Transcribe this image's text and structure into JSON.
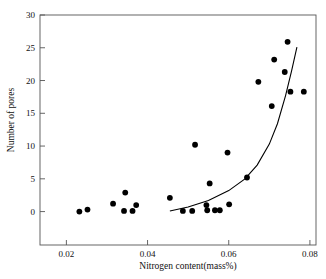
{
  "chart_data": {
    "type": "scatter",
    "title": "",
    "xlabel": "Nitrogen content(mass%)",
    "ylabel": "Number of pores",
    "xlim": [
      0.0135,
      0.0815
    ],
    "ylim": [
      -5.1,
      30
    ],
    "xticks": [
      0.02,
      0.04,
      0.06,
      0.08
    ],
    "xtick_labels": [
      "0.02",
      "0.04",
      "0.06",
      "0.08"
    ],
    "yticks": [
      0,
      5,
      10,
      15,
      20,
      25,
      30
    ],
    "ytick_labels": [
      "0",
      "5",
      "10",
      "15",
      "20",
      "25",
      "30"
    ],
    "grid": false,
    "legend": null,
    "marker_color": "#000000",
    "line_color": "#000000",
    "frame_color": "#555555",
    "points": [
      {
        "x": 0.0232,
        "y": 0.0
      },
      {
        "x": 0.0252,
        "y": 0.3
      },
      {
        "x": 0.0315,
        "y": 1.2
      },
      {
        "x": 0.0345,
        "y": 2.9
      },
      {
        "x": 0.0342,
        "y": 0.1
      },
      {
        "x": 0.0363,
        "y": 0.1
      },
      {
        "x": 0.0372,
        "y": 1.0
      },
      {
        "x": 0.0455,
        "y": 2.1
      },
      {
        "x": 0.0487,
        "y": 0.1
      },
      {
        "x": 0.051,
        "y": 0.1
      },
      {
        "x": 0.0517,
        "y": 10.2
      },
      {
        "x": 0.0545,
        "y": 1.0
      },
      {
        "x": 0.0547,
        "y": 0.2
      },
      {
        "x": 0.0553,
        "y": 4.3
      },
      {
        "x": 0.0566,
        "y": 0.2
      },
      {
        "x": 0.0578,
        "y": 0.2
      },
      {
        "x": 0.0597,
        "y": 9.0
      },
      {
        "x": 0.0601,
        "y": 1.1
      },
      {
        "x": 0.0645,
        "y": 5.2
      },
      {
        "x": 0.0673,
        "y": 19.8
      },
      {
        "x": 0.0706,
        "y": 16.1
      },
      {
        "x": 0.0712,
        "y": 23.2
      },
      {
        "x": 0.0738,
        "y": 21.3
      },
      {
        "x": 0.0745,
        "y": 25.9
      },
      {
        "x": 0.0752,
        "y": 18.3
      },
      {
        "x": 0.0785,
        "y": 18.3
      }
    ],
    "fit_curve": {
      "name": "exponential-trend",
      "points": [
        {
          "x": 0.0455,
          "y": 0.1
        },
        {
          "x": 0.05,
          "y": 0.7
        },
        {
          "x": 0.055,
          "y": 1.7
        },
        {
          "x": 0.06,
          "y": 3.2
        },
        {
          "x": 0.064,
          "y": 5.0
        },
        {
          "x": 0.067,
          "y": 7.1
        },
        {
          "x": 0.07,
          "y": 10.3
        },
        {
          "x": 0.072,
          "y": 13.4
        },
        {
          "x": 0.074,
          "y": 17.7
        },
        {
          "x": 0.0755,
          "y": 21.5
        },
        {
          "x": 0.0768,
          "y": 25.1
        }
      ]
    }
  }
}
